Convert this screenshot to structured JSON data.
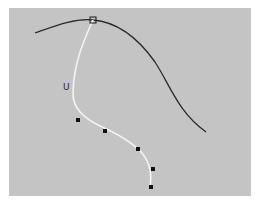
{
  "viewport": {
    "background": "#c4c4c4",
    "label": "U",
    "label_pos": [
      63,
      83
    ]
  },
  "curves": {
    "rail_curve": {
      "color": "#2b2b2b",
      "path": "M35,33 C55,26 75,18 93,20 C118,22 138,38 155,62 C170,85 178,112 206,132"
    },
    "profile_curve": {
      "color": "#f4f4f4",
      "path": "M93,20 C84,40 74,62 73,92 C72,108 84,118 100,126 C118,134 132,142 142,153 C150,163 152,175 150,187"
    }
  },
  "control_square": {
    "x": 93,
    "y": 20,
    "size": 6
  },
  "control_points": [
    {
      "x": 78,
      "y": 120
    },
    {
      "x": 105,
      "y": 131
    },
    {
      "x": 138,
      "y": 149
    },
    {
      "x": 153,
      "y": 169
    },
    {
      "x": 151,
      "y": 187
    }
  ]
}
